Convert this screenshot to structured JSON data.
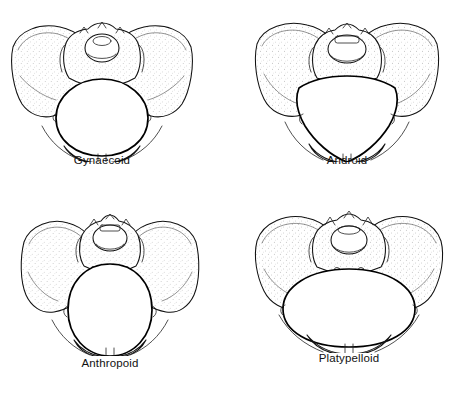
{
  "page": {
    "running_head": "DISPROPORTION AND OBSTRUCTED LABOUR",
    "background_color": "#ffffff",
    "ink_color": "#111111"
  },
  "figure": {
    "kind": "anatomical-line-drawing-grid",
    "rows": 2,
    "columns": 2,
    "panels": [
      {
        "id": "gynaecoid",
        "label": "Gynaecoid",
        "position": "top-left",
        "inlet_shape": "rounded / slightly transverse oval"
      },
      {
        "id": "android",
        "label": "Android",
        "position": "top-right",
        "inlet_shape": "heart-shaped / triangular with narrow forepelvis"
      },
      {
        "id": "anthropoid",
        "label": "Anthropoid",
        "position": "bottom-left",
        "inlet_shape": "long anteroposterior oval"
      },
      {
        "id": "platypelloid",
        "label": "Platypelloid",
        "position": "bottom-right",
        "inlet_shape": "wide flattened transverse oval"
      }
    ]
  }
}
